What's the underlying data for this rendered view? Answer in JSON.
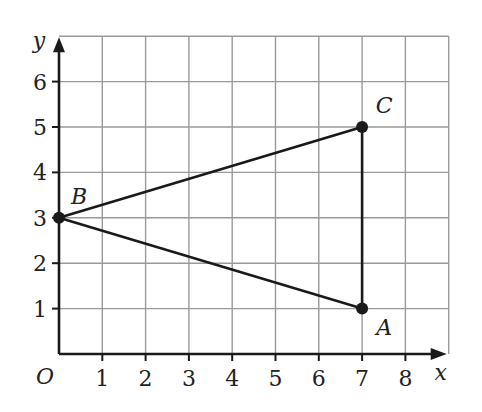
{
  "figure": {
    "x_axis_label": "x",
    "y_axis_label": "y",
    "origin_label": "O",
    "x_ticks": [
      "1",
      "2",
      "3",
      "4",
      "5",
      "6",
      "7",
      "8"
    ],
    "y_ticks": [
      "1",
      "2",
      "3",
      "4",
      "5",
      "6"
    ],
    "grid": {
      "x_range": [
        0,
        9
      ],
      "y_range": [
        0,
        7
      ]
    },
    "points": [
      {
        "label": "A",
        "x": 7,
        "y": 1
      },
      {
        "label": "B",
        "x": 0,
        "y": 3
      },
      {
        "label": "C",
        "x": 7,
        "y": 5
      }
    ],
    "segments": [
      [
        "B",
        "C"
      ],
      [
        "B",
        "A"
      ],
      [
        "A",
        "C"
      ]
    ],
    "colors": {
      "grid": "#9a9a9a",
      "axis": "#1a1a1a",
      "shape": "#1a1a1a"
    }
  }
}
